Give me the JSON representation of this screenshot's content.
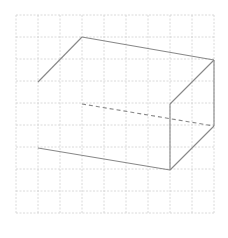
{
  "diagram": {
    "title": "",
    "grid": {
      "x0": 16,
      "y0": 15,
      "cell": 22,
      "cols": 9,
      "rows": 9,
      "color": "#d0d0d0"
    },
    "shape": "rectangular prism (oblique projection) with hidden edge dashed",
    "edge_color": "#888888",
    "solid_edges": [
      [
        38,
        82,
        82,
        37
      ],
      [
        82,
        37,
        214,
        60
      ],
      [
        214,
        60,
        170,
        104
      ],
      [
        214,
        60,
        214,
        126
      ],
      [
        214,
        126,
        170,
        170
      ],
      [
        170,
        104,
        170,
        170
      ],
      [
        170,
        170,
        38,
        148
      ]
    ],
    "hidden_edges": [
      [
        82,
        104,
        214,
        126
      ]
    ]
  }
}
